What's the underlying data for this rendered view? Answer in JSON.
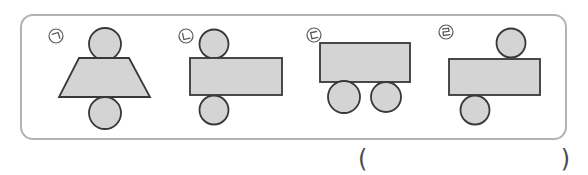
{
  "figure": {
    "groups": [
      {
        "label": "ㄱ",
        "label_name": "giyeok",
        "shapes": [
          "circle",
          "trapezoid",
          "circle"
        ],
        "arrangement": "circle on top, trapezoid in middle, circle on bottom"
      },
      {
        "label": "ㄴ",
        "label_name": "nieun",
        "shapes": [
          "circle",
          "rectangle",
          "circle"
        ],
        "arrangement": "circle on top, wide rectangle in middle, circle on bottom"
      },
      {
        "label": "ㄷ",
        "label_name": "digeut",
        "shapes": [
          "rectangle",
          "circle",
          "circle"
        ],
        "arrangement": "rectangle on top, two circles below"
      },
      {
        "label": "ㄹ",
        "label_name": "rieul",
        "shapes": [
          "circle",
          "rectangle",
          "circle"
        ],
        "arrangement": "circle at top right, rectangle in middle, circle at bottom left"
      }
    ]
  },
  "answer": {
    "open_paren": "(",
    "close_paren": ")"
  },
  "colors": {
    "shape_fill": "#d4d4d4",
    "shape_stroke": "#383838",
    "panel_border": "#b3b3b3",
    "label_stroke": "#5a5a5a",
    "paren_color": "#4a4a4a",
    "background": "#ffffff"
  }
}
